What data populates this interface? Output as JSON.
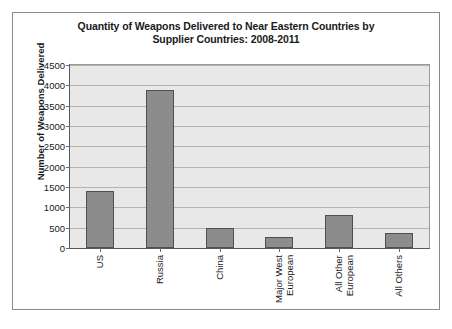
{
  "chart_data": {
    "type": "bar",
    "title": "Quantity of Weapons Delivered to Near Eastern Countries by Supplier Countries: 2008-2011",
    "title_lines": [
      "Quantity of Weapons Delivered to Near Eastern Countries by",
      "Supplier Countries: 2008-2011"
    ],
    "xlabel": "",
    "ylabel": "Number of Weapons Delivered",
    "categories": [
      "US",
      "Russia",
      "China",
      "Major West\nEuropean",
      "All Other\nEuropean",
      "All Others"
    ],
    "values": [
      1400,
      3880,
      480,
      280,
      800,
      370
    ],
    "ylim": [
      0,
      4500
    ],
    "ytick_labels": [
      "0",
      "500",
      "1000",
      "1500",
      "2000",
      "2500",
      "3000",
      "3500",
      "4000",
      "4500"
    ],
    "ytick_values": [
      0,
      500,
      1000,
      1500,
      2000,
      2500,
      3000,
      3500,
      4000,
      4500
    ],
    "grid": true,
    "legend": "none",
    "colors": {
      "bar_fill": "#8c8c8c",
      "bar_border": "#4f4f4f",
      "plot_background": "#e8e8e8",
      "gridline": "#b4b4b4",
      "axis": "#5a5a5a",
      "frame_border": "#8a8a8a",
      "text": "#1a1a1a"
    }
  }
}
